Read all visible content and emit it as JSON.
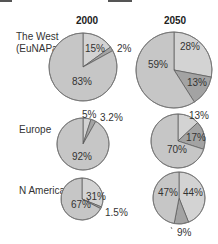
{
  "chart_data": {
    "type": "pie",
    "title": "",
    "columns": [
      "2000",
      "2050"
    ],
    "rows": [
      "The West (EuNAPa)",
      "Europe",
      "N America"
    ],
    "colors": {
      "main": "#c6c6c6",
      "light": "#d3d3d3",
      "dark": "#a3a3a3",
      "stroke": "#555555"
    },
    "charts": [
      {
        "row": "The West (EuNAPa)",
        "year": "2000",
        "slices": [
          {
            "label": "15%",
            "value": 15,
            "shade": "light"
          },
          {
            "label": "2%",
            "value": 2,
            "shade": "dark"
          },
          {
            "label": "83%",
            "value": 83,
            "shade": "main"
          }
        ]
      },
      {
        "row": "The West (EuNAPa)",
        "year": "2050",
        "slices": [
          {
            "label": "28%",
            "value": 28,
            "shade": "light"
          },
          {
            "label": "13%",
            "value": 13,
            "shade": "dark"
          },
          {
            "label": "59%",
            "value": 59,
            "shade": "main"
          }
        ]
      },
      {
        "row": "Europe",
        "year": "2000",
        "slices": [
          {
            "label": "5%",
            "value": 5,
            "shade": "light"
          },
          {
            "label": "3.2%",
            "value": 3.2,
            "shade": "dark"
          },
          {
            "label": "92%",
            "value": 92,
            "shade": "main"
          }
        ]
      },
      {
        "row": "Europe",
        "year": "2050",
        "slices": [
          {
            "label": "13%",
            "value": 13,
            "shade": "light"
          },
          {
            "label": "17%",
            "value": 17,
            "shade": "dark"
          },
          {
            "label": "70%",
            "value": 70,
            "shade": "main"
          }
        ]
      },
      {
        "row": "N America",
        "year": "2000",
        "slices": [
          {
            "label": "31%",
            "value": 31,
            "shade": "light"
          },
          {
            "label": "1.5%",
            "value": 1.5,
            "shade": "dark"
          },
          {
            "label": "67%",
            "value": 67,
            "shade": "main"
          }
        ]
      },
      {
        "row": "N America",
        "year": "2050",
        "slices": [
          {
            "label": "44%",
            "value": 44,
            "shade": "light"
          },
          {
            "label": "9%",
            "value": 9,
            "shade": "dark"
          },
          {
            "label": "47%",
            "value": 47,
            "shade": "main"
          }
        ]
      }
    ]
  },
  "headers": {
    "col1": "2000",
    "col2": "2050"
  },
  "row_labels": {
    "west_line1": "The West",
    "west_line2": "(EuNAPa)",
    "europe": "Europe",
    "namerica": "N America"
  },
  "labels": {
    "w2000": [
      "15%",
      "2%",
      "83%"
    ],
    "w2050": [
      "28%",
      "13%",
      "59%"
    ],
    "e2000": [
      "5%",
      "3.2%",
      "92%"
    ],
    "e2050": [
      "13%",
      "17%",
      "70%"
    ],
    "n2000": [
      "31%",
      "1.5%",
      "67%"
    ],
    "n2050": [
      "44%",
      "9%",
      "47%"
    ]
  }
}
